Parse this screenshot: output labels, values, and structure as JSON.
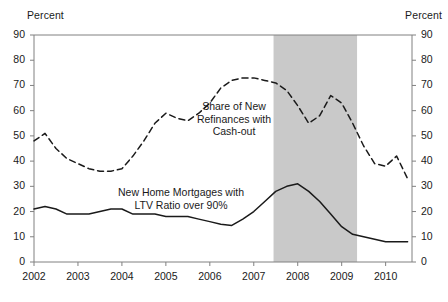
{
  "axis": {
    "unit_label_left": "Percent",
    "unit_label_right": "Percent",
    "y_ticks": [
      "0",
      "10",
      "20",
      "30",
      "40",
      "50",
      "60",
      "70",
      "80",
      "90"
    ],
    "x_ticks": [
      "2002",
      "2003",
      "2004",
      "2005",
      "2006",
      "2007",
      "2008",
      "2009",
      "2010"
    ]
  },
  "series_labels": {
    "refinances": "Share of New\nRefinances with\nCash-out",
    "ltv": "New Home Mortgages with\nLTV Ratio over 90%"
  },
  "colors": {
    "line": "#1a1a1a",
    "axis": "#808080",
    "recession_band": "#c9c9c9",
    "background": "#ffffff"
  },
  "chart_data": {
    "type": "line",
    "title": "",
    "xlabel": "",
    "ylabel": "Percent",
    "xlim": [
      2002.0,
      2010.6
    ],
    "ylim": [
      0,
      90
    ],
    "ytick_step": 10,
    "grid": false,
    "legend_position": "inline-annotation",
    "annotations": [
      {
        "text": "Share of New Refinances with Cash-out",
        "series": "Share of New Refinances with Cash-out",
        "x": 2007.1,
        "y": 63
      },
      {
        "text": "New Home Mortgages with LTV Ratio over 90%",
        "series": "New Home Mortgages with LTV Ratio over 90%",
        "x": 2005.9,
        "y": 27
      }
    ],
    "shaded_regions": [
      {
        "label": "recession",
        "x_start": 2007.45,
        "x_end": 2009.35,
        "color": "#c9c9c9"
      }
    ],
    "series": [
      {
        "name": "Share of New Refinances with Cash-out",
        "style": "dashed",
        "color": "#1a1a1a",
        "x": [
          2002.0,
          2002.25,
          2002.5,
          2002.75,
          2003.0,
          2003.25,
          2003.5,
          2003.75,
          2004.0,
          2004.25,
          2004.5,
          2004.75,
          2005.0,
          2005.25,
          2005.5,
          2005.75,
          2006.0,
          2006.25,
          2006.5,
          2006.75,
          2007.0,
          2007.25,
          2007.5,
          2007.75,
          2008.0,
          2008.25,
          2008.5,
          2008.75,
          2009.0,
          2009.25,
          2009.5,
          2009.75,
          2010.0,
          2010.25,
          2010.5
        ],
        "y": [
          48,
          51,
          45,
          41,
          39,
          37,
          36,
          36,
          37,
          42,
          48,
          55,
          59,
          57,
          56,
          59,
          63,
          69,
          72,
          73,
          73,
          72,
          71,
          68,
          62,
          55,
          58,
          66,
          63,
          55,
          46,
          39,
          38,
          42,
          33
        ]
      },
      {
        "name": "New Home Mortgages with LTV Ratio over 90%",
        "style": "solid",
        "color": "#1a1a1a",
        "x": [
          2002.0,
          2002.25,
          2002.5,
          2002.75,
          2003.0,
          2003.25,
          2003.5,
          2003.75,
          2004.0,
          2004.25,
          2004.5,
          2004.75,
          2005.0,
          2005.25,
          2005.5,
          2005.75,
          2006.0,
          2006.25,
          2006.5,
          2006.75,
          2007.0,
          2007.25,
          2007.5,
          2007.75,
          2008.0,
          2008.25,
          2008.5,
          2008.75,
          2009.0,
          2009.25,
          2009.5,
          2009.75,
          2010.0,
          2010.25,
          2010.5
        ],
        "y": [
          21,
          22,
          21,
          19,
          19,
          19,
          20,
          21,
          21,
          19,
          19,
          19,
          18,
          18,
          18,
          17,
          16,
          15,
          14.5,
          17,
          20,
          24,
          28,
          30,
          31,
          28,
          24,
          19,
          14,
          11,
          10,
          9,
          8,
          8,
          8
        ]
      }
    ]
  }
}
